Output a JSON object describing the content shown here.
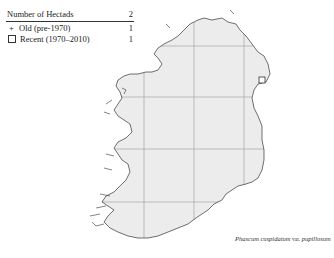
{
  "legend": {
    "header_label": "Number of Hectads",
    "header_total": "2",
    "rows": [
      {
        "symbol": "+",
        "symbol_name": "plus-icon",
        "label": "Old  (pre-1970)",
        "count": "1"
      },
      {
        "symbol": "□",
        "symbol_name": "square-icon",
        "label": "Recent  (1970–2010)",
        "count": "1"
      }
    ]
  },
  "caption": {
    "genus_species": "Phascum cuspidatum",
    "rank": "var.",
    "infraspecific": "pupillosum"
  },
  "map": {
    "region": "Ireland",
    "land_fill": "#ececec",
    "coast_stroke": "#333333",
    "grid_stroke": "#9a9a9a",
    "records": [
      {
        "type": "recent",
        "marker": "square",
        "x": 262,
        "y": 80
      },
      {
        "type": "old",
        "marker": "plus",
        "x": 262,
        "y": 80
      }
    ]
  }
}
